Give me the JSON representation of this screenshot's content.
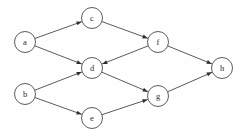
{
  "figure": {
    "kind": "directed-acyclic-graph",
    "width": 242,
    "height": 138,
    "background_color": "#fefefe",
    "node_stroke_color": "#4a4a4a",
    "node_fill_color": "#ffffff",
    "edge_color": "#3d3d3d",
    "label_color": "#2a2a2a",
    "node_radius": 10.5,
    "top_text_fragment": ""
  },
  "nodes": [
    {
      "id": "a",
      "label": "a",
      "x": 25,
      "y": 42
    },
    {
      "id": "b",
      "label": "b",
      "x": 25,
      "y": 94
    },
    {
      "id": "c",
      "label": "c",
      "x": 92,
      "y": 18
    },
    {
      "id": "d",
      "label": "d",
      "x": 92,
      "y": 68
    },
    {
      "id": "e",
      "label": "e",
      "x": 92,
      "y": 118
    },
    {
      "id": "f",
      "label": "f",
      "x": 158,
      "y": 42
    },
    {
      "id": "g",
      "label": "g",
      "x": 158,
      "y": 96
    },
    {
      "id": "h",
      "label": "h",
      "x": 222,
      "y": 68
    }
  ],
  "edges": [
    {
      "id": "a-c",
      "from": "a",
      "to": "c",
      "directed": true
    },
    {
      "id": "a-d",
      "from": "a",
      "to": "d",
      "directed": true
    },
    {
      "id": "b-d",
      "from": "b",
      "to": "d",
      "directed": true
    },
    {
      "id": "b-e",
      "from": "b",
      "to": "e",
      "directed": true
    },
    {
      "id": "c-f",
      "from": "c",
      "to": "f",
      "directed": true
    },
    {
      "id": "f-d",
      "from": "f",
      "to": "d",
      "directed": true
    },
    {
      "id": "f-h",
      "from": "f",
      "to": "h",
      "directed": true
    },
    {
      "id": "d-g",
      "from": "d",
      "to": "g",
      "directed": true
    },
    {
      "id": "e-g",
      "from": "e",
      "to": "g",
      "directed": true
    },
    {
      "id": "g-h",
      "from": "g",
      "to": "h",
      "directed": true
    }
  ]
}
